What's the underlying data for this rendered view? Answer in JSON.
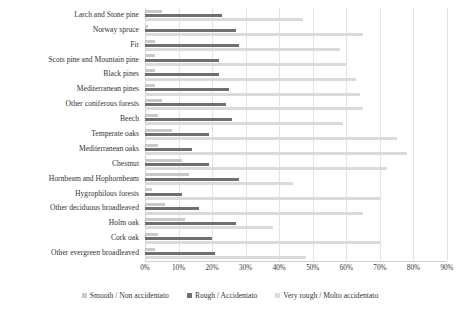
{
  "chart_data": {
    "type": "bar",
    "orientation": "horizontal",
    "title": "",
    "xlabel": "",
    "ylabel": "",
    "xlim": [
      0,
      90
    ],
    "xtick_labels": [
      "0%",
      "10%",
      "20%",
      "30%",
      "40%",
      "50%",
      "60%",
      "70%",
      "80%",
      "90%"
    ],
    "xtick_values": [
      0,
      10,
      20,
      30,
      40,
      50,
      60,
      70,
      80,
      90
    ],
    "grid": true,
    "legend_position": "bottom",
    "categories": [
      "Larch and Stone pine",
      "Norway spruce",
      "Fir",
      "Scots pine and Mountain pine",
      "Black pines",
      "Mediterranean pines",
      "Other coniferous forests",
      "Beech",
      "Temperate oaks",
      "Mediterranean oaks",
      "Chestnut",
      "Hornbeam and Hophornbeam",
      "Hygrophilous forests",
      "Other deciduous broadleaved",
      "Holm oak",
      "Cork oak",
      "Other evergreen broadleaved"
    ],
    "series": [
      {
        "name": "Smooth / Non accidentato",
        "color": "#c9c9c9",
        "values": [
          5,
          1,
          3,
          3,
          3,
          3,
          5,
          4,
          8,
          4,
          11,
          13,
          2,
          6,
          12,
          4,
          3
        ]
      },
      {
        "name": "Rough / Accidentato",
        "color": "#6f6f6f",
        "values": [
          23,
          27,
          28,
          22,
          22,
          25,
          24,
          26,
          19,
          14,
          19,
          28,
          11,
          16,
          27,
          20,
          21
        ]
      },
      {
        "name": "Very rough / Molto accidentato",
        "color": "#dadada",
        "values": [
          47,
          65,
          58,
          60,
          63,
          64,
          65,
          59,
          75,
          78,
          72,
          44,
          70,
          65,
          38,
          70,
          48
        ]
      }
    ]
  }
}
